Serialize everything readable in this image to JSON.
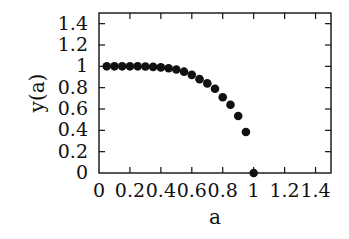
{
  "chart_data": {
    "type": "scatter",
    "title": "",
    "xlabel": "a",
    "ylabel": "y(a)",
    "xlim": [
      0,
      1.5
    ],
    "ylim": [
      0,
      1.5
    ],
    "grid": false,
    "legend": null,
    "x_ticks": [
      0,
      0.2,
      0.4,
      0.6,
      0.8,
      1,
      1.2,
      1.4
    ],
    "x_tick_labels": [
      "0",
      "0.2",
      "0.4",
      "0.6",
      "0.8",
      "1",
      "1.2",
      "1.4"
    ],
    "y_ticks": [
      0,
      0.2,
      0.4,
      0.6,
      0.8,
      1,
      1.2,
      1.4
    ],
    "y_tick_labels": [
      "0",
      "0.2",
      "0.4",
      "0.6",
      "0.8",
      "1",
      "1.2",
      "1.4"
    ],
    "series": [
      {
        "name": "y(a)",
        "marker": "filled-circle",
        "color": "#111111",
        "x": [
          0.05,
          0.1,
          0.15,
          0.2,
          0.25,
          0.3,
          0.35,
          0.4,
          0.45,
          0.5,
          0.55,
          0.6,
          0.65,
          0.7,
          0.75,
          0.8,
          0.85,
          0.9,
          0.95,
          1.0
        ],
        "y": [
          1.0,
          1.0,
          1.0,
          1.0,
          1.0,
          0.998,
          0.995,
          0.99,
          0.982,
          0.97,
          0.95,
          0.92,
          0.88,
          0.84,
          0.79,
          0.71,
          0.64,
          0.535,
          0.385,
          0.0
        ]
      }
    ]
  }
}
